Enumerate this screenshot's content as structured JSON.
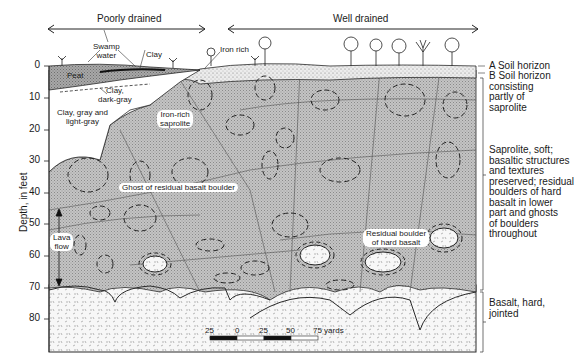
{
  "header": {
    "poorly_drained": "Poorly drained",
    "well_drained": "Well drained"
  },
  "y_axis": {
    "label": "Depth, in feet",
    "ticks": [
      "0",
      "10",
      "20",
      "30",
      "40",
      "50",
      "60",
      "70",
      "80"
    ]
  },
  "labels": {
    "swamp_water": "Swamp\nwater",
    "swamp_line1": "Swamp",
    "swamp_line2": "water",
    "clay": "Clay",
    "iron_rich": "Iron rich",
    "peat": "Peat",
    "clay_dark_1": "Clay,",
    "clay_dark_2": "dark-gray",
    "clay_gray_1": "Clay, gray and",
    "clay_gray_2": "light-gray",
    "iron_rich_saprolite_1": "Iron-rich",
    "iron_rich_saprolite_2": "saprolite",
    "ghost_boulder": "Ghost of residual basalt boulder",
    "lava_flow_1": "Lava",
    "lava_flow_2": "flow",
    "residual_boulder_1": "Residual boulder",
    "residual_boulder_2": "of hard basalt"
  },
  "legend": {
    "a_horizon": "A Soil horizon",
    "b_horizon": [
      "B Soil horizon",
      "consisting",
      "partly of",
      "saprolite"
    ],
    "saprolite": [
      "Saprolite, soft;",
      "basaltic structures",
      "and textures",
      "preserved; residual",
      "boulders of hard",
      "basalt in lower",
      "part and ghosts",
      "of boulders",
      "throughout"
    ],
    "basalt": [
      "Basalt, hard,",
      "jointed"
    ]
  },
  "scale_bar": {
    "ticks": [
      "25",
      "0",
      "25",
      "50",
      "75 yards"
    ]
  },
  "colors": {
    "line": "#2a2a2a",
    "saprolite_fill": "#bdbdbd",
    "peat_fill": "#9a9a9a",
    "soil_fill": "#e6e6e6",
    "basalt_fill": "#f4f4f4"
  }
}
